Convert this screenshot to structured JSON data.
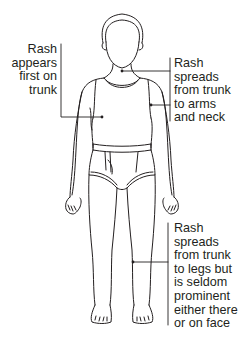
{
  "diagram": {
    "stroke_color": "#231f20",
    "background": "#ffffff",
    "annotations": [
      {
        "id": "trunk",
        "side": "left",
        "lines": [
          "Rash",
          "appears",
          "first on",
          "trunk"
        ],
        "points_to": "trunk"
      },
      {
        "id": "arms-neck",
        "side": "right",
        "lines": [
          "Rash",
          "spreads",
          "from trunk",
          "to arms",
          "and neck"
        ],
        "points_to": [
          "neck",
          "arm"
        ]
      },
      {
        "id": "legs",
        "side": "right",
        "lines": [
          "Rash",
          "spreads",
          "from trunk",
          "to legs but",
          "is seldom",
          "prominent",
          "either there",
          "or on face"
        ],
        "points_to": "leg"
      }
    ]
  }
}
